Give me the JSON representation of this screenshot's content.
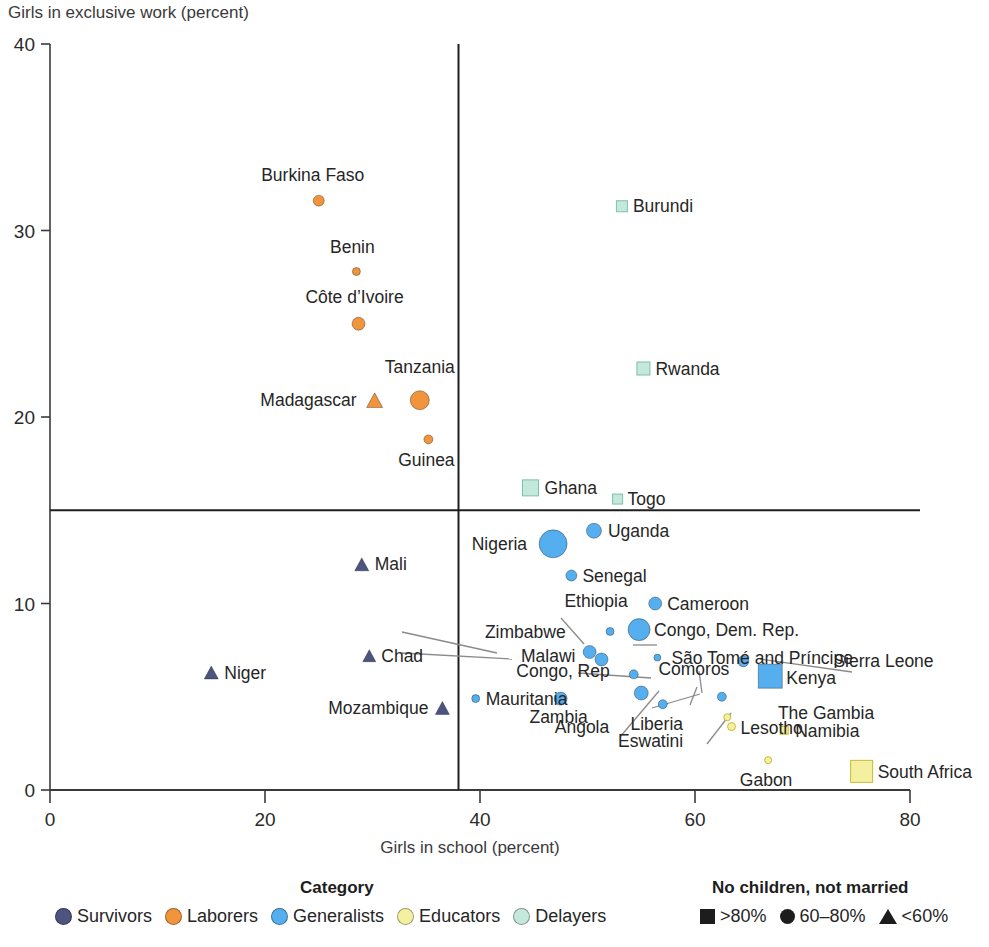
{
  "chart_data": {
    "type": "scatter",
    "title": "",
    "xlabel": "Girls in school (percent)",
    "ylabel": "Girls in exclusive work (percent)",
    "xlim": [
      0,
      80
    ],
    "ylim": [
      0,
      40
    ],
    "xticks": [
      0,
      20,
      40,
      60,
      80
    ],
    "yticks": [
      0,
      10,
      20,
      30,
      40
    ],
    "grid": false,
    "reference_lines": {
      "vertical_x": 38,
      "horizontal_y": 15
    },
    "colors": {
      "survivors": "#4d5480",
      "laborers": "#f0953c",
      "generalists": "#55aeee",
      "educators": "#f5f0a0",
      "delayers": "#c5e8dd",
      "axis": "#3a3a3a",
      "text": "#262626"
    },
    "categories": [
      {
        "key": "survivors",
        "label": "Survivors",
        "color": "#4d5480"
      },
      {
        "key": "laborers",
        "label": "Laborers",
        "color": "#f0953c"
      },
      {
        "key": "generalists",
        "label": "Generalists",
        "color": "#55aeee"
      },
      {
        "key": "educators",
        "label": "Educators",
        "color": "#f5f0a0"
      },
      {
        "key": "delayers",
        "label": "Delayers",
        "color": "#c5e8dd"
      }
    ],
    "shape_legend": [
      {
        "shape": "square",
        "label": ">80%"
      },
      {
        "shape": "circle",
        "label": "60–80%"
      },
      {
        "shape": "triangle",
        "label": "<60%"
      }
    ],
    "points": [
      {
        "name": "Burkina Faso",
        "x": 25.0,
        "y": 31.6,
        "category": "laborers",
        "shape": "circle",
        "size": 11,
        "label_dx": -6,
        "label_dy": -20,
        "anchor": "middle"
      },
      {
        "name": "Benin",
        "x": 28.5,
        "y": 27.8,
        "category": "laborers",
        "shape": "circle",
        "size": 8,
        "label_dx": -4,
        "label_dy": -19,
        "anchor": "middle"
      },
      {
        "name": "Côte d’Ivoire",
        "x": 28.7,
        "y": 25.0,
        "category": "laborers",
        "shape": "circle",
        "size": 13,
        "label_dx": -4,
        "label_dy": -21,
        "anchor": "middle"
      },
      {
        "name": "Tanzania",
        "x": 34.4,
        "y": 20.9,
        "category": "laborers",
        "shape": "circle",
        "size": 19,
        "label_dx": 0,
        "label_dy": -27,
        "anchor": "middle"
      },
      {
        "name": "Madagascar",
        "x": 30.2,
        "y": 20.9,
        "category": "laborers",
        "shape": "triangle",
        "size": 16,
        "label_dx": -18,
        "label_dy": 6,
        "anchor": "end"
      },
      {
        "name": "Guinea",
        "x": 35.2,
        "y": 18.8,
        "category": "laborers",
        "shape": "circle",
        "size": 9,
        "label_dx": -2,
        "label_dy": 27,
        "anchor": "middle"
      },
      {
        "name": "Burundi",
        "x": 53.2,
        "y": 31.3,
        "category": "delayers",
        "shape": "square",
        "size": 11,
        "label_dx": 11,
        "label_dy": 6,
        "anchor": "start"
      },
      {
        "name": "Rwanda",
        "x": 55.2,
        "y": 22.6,
        "category": "delayers",
        "shape": "square",
        "size": 13,
        "label_dx": 12,
        "label_dy": 6,
        "anchor": "start"
      },
      {
        "name": "Ghana",
        "x": 44.7,
        "y": 16.2,
        "category": "delayers",
        "shape": "square",
        "size": 16,
        "label_dx": 14,
        "label_dy": 6,
        "anchor": "start"
      },
      {
        "name": "Togo",
        "x": 52.8,
        "y": 15.6,
        "category": "delayers",
        "shape": "square",
        "size": 10,
        "label_dx": 10,
        "label_dy": 6,
        "anchor": "start"
      },
      {
        "name": "Nigeria",
        "x": 46.8,
        "y": 13.2,
        "category": "generalists",
        "shape": "circle",
        "size": 28,
        "label_dx": -26,
        "label_dy": 6,
        "anchor": "end"
      },
      {
        "name": "Uganda",
        "x": 50.6,
        "y": 13.9,
        "category": "generalists",
        "shape": "circle",
        "size": 15,
        "label_dx": 14,
        "label_dy": 6,
        "anchor": "start"
      },
      {
        "name": "Senegal",
        "x": 48.5,
        "y": 11.5,
        "category": "generalists",
        "shape": "circle",
        "size": 11,
        "label_dx": 11,
        "label_dy": 6,
        "anchor": "start"
      },
      {
        "name": "Ethiopia",
        "x": 52.1,
        "y": 8.5,
        "category": "generalists",
        "shape": "circle",
        "size": 8,
        "label_dx": -14,
        "label_dy": -24,
        "anchor": "middle"
      },
      {
        "name": "Cameroon",
        "x": 56.3,
        "y": 10.0,
        "category": "generalists",
        "shape": "circle",
        "size": 13,
        "label_dx": 12,
        "label_dy": 6,
        "anchor": "start"
      },
      {
        "name": "Congo, Dem. Rep.",
        "x": 54.8,
        "y": 8.6,
        "category": "generalists",
        "shape": "circle",
        "size": 22,
        "label_dx": 15,
        "label_dy": 6,
        "anchor": "start"
      },
      {
        "name": "Zimbabwe",
        "x": 50.2,
        "y": 7.4,
        "category": "generalists",
        "shape": "circle",
        "size": 13,
        "label_dx": -24,
        "label_dy": -14,
        "anchor": "end"
      },
      {
        "name": "Malawi",
        "x": 51.3,
        "y": 7.0,
        "category": "generalists",
        "shape": "circle",
        "size": 13,
        "label_dx": -26,
        "label_dy": 3,
        "anchor": "end"
      },
      {
        "name": "São Tomé and Príncipe",
        "x": 56.5,
        "y": 7.1,
        "category": "generalists",
        "shape": "circle",
        "size": 7,
        "label_dx": 14,
        "label_dy": 6,
        "anchor": "start"
      },
      {
        "name": "Congo, Rep",
        "x": 54.3,
        "y": 6.2,
        "category": "generalists",
        "shape": "circle",
        "size": 9,
        "label_dx": -24,
        "label_dy": 3,
        "anchor": "end"
      },
      {
        "name": "Comoros",
        "x": 64.5,
        "y": 6.9,
        "category": "generalists",
        "shape": "circle",
        "size": 11,
        "label_dx": -14,
        "label_dy": 14,
        "anchor": "end"
      },
      {
        "name": "Kenya",
        "x": 67.0,
        "y": 6.1,
        "category": "generalists",
        "shape": "square",
        "size": 24,
        "label_dx": 16,
        "label_dy": 8,
        "anchor": "start"
      },
      {
        "name": "Sierra Leone",
        "x": 64.5,
        "y": 6.9,
        "category": "generalists",
        "shape": "none",
        "size": 0,
        "label_dx": 90,
        "label_dy": 6,
        "anchor": "start"
      },
      {
        "name": "Mauritania",
        "x": 39.6,
        "y": 4.9,
        "category": "generalists",
        "shape": "circle",
        "size": 8,
        "label_dx": 10,
        "label_dy": 6,
        "anchor": "start"
      },
      {
        "name": "Zambia",
        "x": 47.5,
        "y": 4.9,
        "category": "generalists",
        "shape": "circle",
        "size": 13,
        "label_dx": -2,
        "label_dy": 24,
        "anchor": "middle"
      },
      {
        "name": "Angola",
        "x": 55.0,
        "y": 5.2,
        "category": "generalists",
        "shape": "circle",
        "size": 14,
        "label_dx": -32,
        "label_dy": 40,
        "anchor": "end"
      },
      {
        "name": "Liberia",
        "x": 57.0,
        "y": 4.6,
        "category": "generalists",
        "shape": "circle",
        "size": 9,
        "label_dx": -6,
        "label_dy": 26,
        "anchor": "middle"
      },
      {
        "name": "The Gambia",
        "x": 62.5,
        "y": 5.0,
        "category": "generalists",
        "shape": "circle",
        "size": 9,
        "label_dx": 56,
        "label_dy": 22,
        "anchor": "start"
      },
      {
        "name": "Eswatini",
        "x": 63.0,
        "y": 3.9,
        "category": "educators",
        "shape": "circle",
        "size": 7,
        "label_dx": -44,
        "label_dy": 30,
        "anchor": "end"
      },
      {
        "name": "Lesotho",
        "x": 63.4,
        "y": 3.4,
        "category": "educators",
        "shape": "circle",
        "size": 8,
        "label_dx": 9,
        "label_dy": 7,
        "anchor": "start"
      },
      {
        "name": "Namibia",
        "x": 68.3,
        "y": 3.2,
        "category": "educators",
        "shape": "square",
        "size": 8,
        "label_dx": 11,
        "label_dy": 7,
        "anchor": "start"
      },
      {
        "name": "Gabon",
        "x": 66.8,
        "y": 1.6,
        "category": "educators",
        "shape": "circle",
        "size": 7,
        "label_dx": -2,
        "label_dy": 26,
        "anchor": "middle"
      },
      {
        "name": "South Africa",
        "x": 75.5,
        "y": 1.0,
        "category": "educators",
        "shape": "square",
        "size": 22,
        "label_dx": 16,
        "label_dy": 7,
        "anchor": "start"
      },
      {
        "name": "Mali",
        "x": 29.0,
        "y": 12.1,
        "category": "survivors",
        "shape": "triangle",
        "size": 14,
        "label_dx": 13,
        "label_dy": 6,
        "anchor": "start"
      },
      {
        "name": "Chad",
        "x": 29.7,
        "y": 7.2,
        "category": "survivors",
        "shape": "triangle",
        "size": 13,
        "label_dx": 12,
        "label_dy": 6,
        "anchor": "start"
      },
      {
        "name": "Niger",
        "x": 15.0,
        "y": 6.3,
        "category": "survivors",
        "shape": "triangle",
        "size": 14,
        "label_dx": 13,
        "label_dy": 6,
        "anchor": "start"
      },
      {
        "name": "Mozambique",
        "x": 36.5,
        "y": 4.4,
        "category": "survivors",
        "shape": "triangle",
        "size": 14,
        "label_dx": -14,
        "label_dy": 6,
        "anchor": "end"
      }
    ],
    "leader_lines": [
      {
        "from_label": "Zimbabwe",
        "x1": 402,
        "y1": 632,
        "x2": 497,
        "y2": 653
      },
      {
        "from_label": "Malawi",
        "x1": 402,
        "y1": 653,
        "x2": 512,
        "y2": 659
      },
      {
        "from_label": "Ethiopia",
        "x1": 561,
        "y1": 618,
        "x2": 584,
        "y2": 644
      },
      {
        "from_label": "São Tomé and Príncipe",
        "x1": 657,
        "y1": 645,
        "x2": 633,
        "y2": 645
      },
      {
        "from_label": "Congo, Rep",
        "x1": 578,
        "y1": 673,
        "x2": 651,
        "y2": 678
      },
      {
        "from_label": "Sierra Leone",
        "x1": 852,
        "y1": 672,
        "x2": 760,
        "y2": 659
      },
      {
        "from_label": "The Gambia",
        "x1": 652,
        "y1": 708,
        "x2": 700,
        "y2": 694
      },
      {
        "from_label": "Comoros",
        "x1": 699,
        "y1": 671,
        "x2": 702,
        "y2": 693
      },
      {
        "from_label": "Angola",
        "x1": 620,
        "y1": 737,
        "x2": 659,
        "y2": 691
      },
      {
        "from_label": "Liberia",
        "x1": 690,
        "y1": 705,
        "x2": 697,
        "y2": 687
      },
      {
        "from_label": "Eswatini",
        "x1": 707,
        "y1": 744,
        "x2": 731,
        "y2": 713
      }
    ]
  },
  "legend": {
    "category_heading": "Category",
    "shape_heading": "No children, not married"
  }
}
